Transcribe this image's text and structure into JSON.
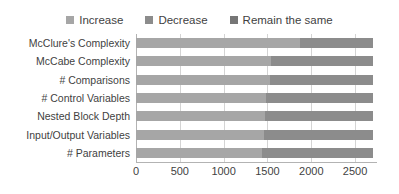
{
  "chart_data": {
    "type": "bar",
    "orientation": "horizontal",
    "stacked": true,
    "title": "",
    "xlabel": "",
    "ylabel": "",
    "xlim": [
      0,
      2750
    ],
    "grid": true,
    "legend_position": "top",
    "xticks": [
      0,
      500,
      1000,
      1500,
      2000,
      2500
    ],
    "xtick_labels": [
      "0",
      "500",
      "1000",
      "1500",
      "2000",
      "2500"
    ],
    "categories": [
      "McClure's Complexity",
      "McCabe Complexity",
      "# Comparisons",
      "# Control Variables",
      "Nested Block Depth",
      "Input/Output Variables",
      "# Parameters"
    ],
    "series": [
      {
        "name": "Increase",
        "color": "#a6a6a6",
        "values": [
          1870,
          1545,
          1530,
          1485,
          1470,
          1455,
          1440
        ]
      },
      {
        "name": "Decrease",
        "color": "#8c8c8c",
        "values": [
          840,
          1165,
          1180,
          1225,
          1240,
          1255,
          1270
        ]
      },
      {
        "name": "Remain the same",
        "color": "#767676",
        "values": [
          0,
          0,
          0,
          0,
          0,
          0,
          0
        ]
      }
    ],
    "totals": [
      2710,
      2710,
      2710,
      2710,
      2710,
      2710,
      2710
    ]
  },
  "legend": {
    "items": [
      {
        "label": "Increase",
        "color": "#a6a6a6"
      },
      {
        "label": "Decrease",
        "color": "#8c8c8c"
      },
      {
        "label": "Remain the same",
        "color": "#767676"
      }
    ]
  },
  "colors": {
    "gridline": "#d4d4d4",
    "axis": "#b3b3b3",
    "text": "#3f3f3f",
    "background": "#ffffff"
  }
}
